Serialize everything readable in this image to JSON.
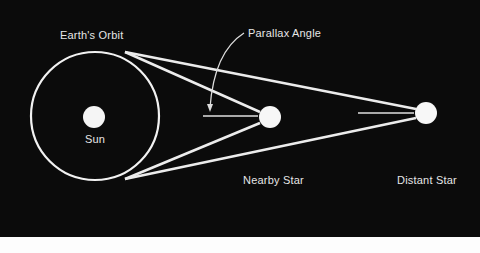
{
  "diagram": {
    "colors": {
      "background": "#0b0b0b",
      "foreground": "#f2f2f2",
      "text": "#e6e6e6",
      "footer": "#fdfdfd"
    },
    "labels": {
      "earths_orbit": "Earth's Orbit",
      "parallax_angle": "Parallax Angle",
      "sun": "Sun",
      "nearby_star": "Nearby Star",
      "distant_star": "Distant Star"
    },
    "geometry": {
      "orbit": {
        "cx": 95,
        "cy": 116,
        "r": 64
      },
      "sun": {
        "cx": 94,
        "cy": 117,
        "r": 11
      },
      "nearby_star": {
        "cx": 270,
        "cy": 117,
        "r": 11
      },
      "distant_star": {
        "cx": 426,
        "cy": 113,
        "r": 11
      },
      "tangent_top": {
        "x": 125,
        "y": 52
      },
      "tangent_bottom": {
        "x": 125,
        "y": 179
      }
    }
  }
}
